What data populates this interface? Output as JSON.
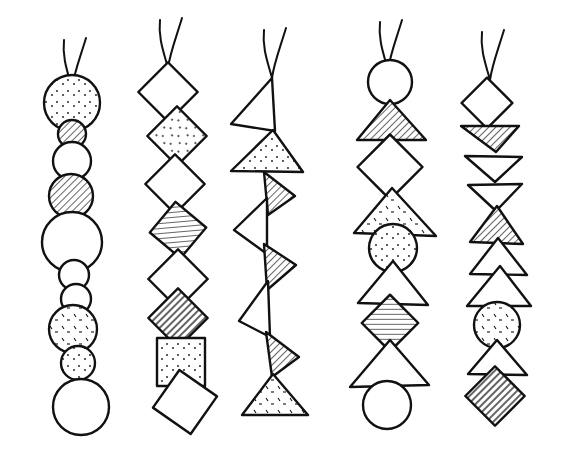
{
  "title": "Five hand-drawn bead strands",
  "colors": {
    "ink": "#111111",
    "paper": "#ffffff"
  },
  "strands": [
    {
      "id": "strand-1",
      "kind": "circles",
      "string": {
        "x": 72,
        "y": 88
      },
      "beads": [
        {
          "shape": "circle",
          "cx": 72,
          "cy": 103,
          "r": 28,
          "fill": "speckle"
        },
        {
          "shape": "circle",
          "cx": 72,
          "cy": 134,
          "r": 14,
          "fill": "hatch"
        },
        {
          "shape": "circle",
          "cx": 72,
          "cy": 161,
          "r": 19,
          "fill": "plain"
        },
        {
          "shape": "circle",
          "cx": 71,
          "cy": 196,
          "r": 22,
          "fill": "hatch"
        },
        {
          "shape": "circle",
          "cx": 72,
          "cy": 242,
          "r": 30,
          "fill": "plain"
        },
        {
          "shape": "circle",
          "cx": 74,
          "cy": 275,
          "r": 15,
          "fill": "plain"
        },
        {
          "shape": "circle",
          "cx": 76,
          "cy": 299,
          "r": 15,
          "fill": "plain"
        },
        {
          "shape": "circle",
          "cx": 73,
          "cy": 329,
          "r": 24,
          "fill": "dash"
        },
        {
          "shape": "circle",
          "cx": 78,
          "cy": 363,
          "r": 17,
          "fill": "speckle"
        },
        {
          "shape": "circle",
          "cx": 81,
          "cy": 407,
          "r": 28,
          "fill": "plain"
        }
      ]
    },
    {
      "id": "strand-2",
      "kind": "diamonds",
      "string": {
        "x": 168,
        "y": 68
      },
      "beads": [
        {
          "shape": "diamond",
          "cx": 168,
          "cy": 92,
          "s": 42,
          "rot": 45,
          "fill": "plain"
        },
        {
          "shape": "diamond",
          "cx": 177,
          "cy": 136,
          "s": 42,
          "rot": 45,
          "fill": "speckle"
        },
        {
          "shape": "diamond",
          "cx": 175,
          "cy": 184,
          "s": 42,
          "rot": 45,
          "fill": "plain"
        },
        {
          "shape": "diamond",
          "cx": 178,
          "cy": 230,
          "s": 40,
          "rot": 40,
          "fill": "hatch"
        },
        {
          "shape": "diamond",
          "cx": 178,
          "cy": 279,
          "s": 42,
          "rot": 45,
          "fill": "plain"
        },
        {
          "shape": "diamond",
          "cx": 178,
          "cy": 318,
          "s": 42,
          "rot": 45,
          "fill": "vhatch"
        },
        {
          "shape": "square",
          "cx": 181,
          "cy": 362,
          "s": 48,
          "rot": 0,
          "fill": "speckle"
        },
        {
          "shape": "diamond",
          "cx": 185,
          "cy": 402,
          "s": 46,
          "rot": 35,
          "fill": "plain"
        }
      ]
    },
    {
      "id": "strand-3",
      "kind": "triangles",
      "string": {
        "x": 272,
        "y": 78
      },
      "beads": [
        {
          "shape": "tri",
          "pts": [
            [
              272,
              78
            ],
            [
              275,
              131
            ],
            [
              231,
              124
            ]
          ],
          "fill": "plain"
        },
        {
          "shape": "tri",
          "pts": [
            [
              273,
              130
            ],
            [
              303,
              172
            ],
            [
              231,
              171
            ]
          ],
          "fill": "speckle"
        },
        {
          "shape": "tri",
          "pts": [
            [
              264,
              172
            ],
            [
              295,
              196
            ],
            [
              268,
              215
            ]
          ],
          "fill": "hatch"
        },
        {
          "shape": "tri",
          "pts": [
            [
              267,
              198
            ],
            [
              267,
              254
            ],
            [
              234,
              230
            ]
          ],
          "fill": "plain"
        },
        {
          "shape": "tri",
          "pts": [
            [
              264,
              244
            ],
            [
              296,
              265
            ],
            [
              267,
              290
            ]
          ],
          "fill": "hatch"
        },
        {
          "shape": "tri",
          "pts": [
            [
              268,
              281
            ],
            [
              270,
              337
            ],
            [
              239,
              321
            ]
          ],
          "fill": "plain"
        },
        {
          "shape": "tri",
          "pts": [
            [
              266,
              332
            ],
            [
              299,
              357
            ],
            [
              272,
              377
            ]
          ],
          "fill": "hatch"
        },
        {
          "shape": "tri",
          "pts": [
            [
              273,
              374
            ],
            [
              308,
              415
            ],
            [
              242,
              415
            ]
          ],
          "fill": "dash"
        }
      ]
    },
    {
      "id": "strand-4",
      "kind": "mixed",
      "string": {
        "x": 388,
        "y": 70
      },
      "beads": [
        {
          "shape": "circle",
          "cx": 390,
          "cy": 82,
          "r": 22,
          "fill": "plain"
        },
        {
          "shape": "tri",
          "pts": [
            [
              390,
              100
            ],
            [
              426,
              140
            ],
            [
              357,
              140
            ]
          ],
          "fill": "hatch"
        },
        {
          "shape": "diamond",
          "cx": 390,
          "cy": 167,
          "s": 46,
          "rot": 45,
          "fill": "plain"
        },
        {
          "shape": "tri",
          "pts": [
            [
              392,
              188
            ],
            [
              436,
              236
            ],
            [
              354,
              233
            ]
          ],
          "fill": "dash"
        },
        {
          "shape": "circle",
          "cx": 393,
          "cy": 248,
          "r": 24,
          "fill": "speckle"
        },
        {
          "shape": "tri",
          "pts": [
            [
              393,
              261
            ],
            [
              428,
              305
            ],
            [
              358,
              303
            ]
          ],
          "fill": "plain"
        },
        {
          "shape": "diamond",
          "cx": 390,
          "cy": 323,
          "s": 40,
          "rot": 45,
          "fill": "hatch"
        },
        {
          "shape": "tri",
          "pts": [
            [
              390,
              340
            ],
            [
              429,
              385
            ],
            [
              350,
              387
            ]
          ],
          "fill": "plain"
        },
        {
          "shape": "circle",
          "cx": 387,
          "cy": 405,
          "r": 24,
          "fill": "plain"
        }
      ]
    },
    {
      "id": "strand-5",
      "kind": "mixed",
      "string": {
        "x": 490,
        "y": 80
      },
      "beads": [
        {
          "shape": "diamond",
          "cx": 487,
          "cy": 103,
          "s": 36,
          "rot": 45,
          "fill": "plain"
        },
        {
          "shape": "tri",
          "pts": [
            [
              461,
              126
            ],
            [
              519,
              126
            ],
            [
              496,
              152
            ]
          ],
          "fill": "hatch"
        },
        {
          "shape": "tri",
          "pts": [
            [
              465,
              156
            ],
            [
              522,
              157
            ],
            [
              495,
              182
            ]
          ],
          "fill": "plain"
        },
        {
          "shape": "tri",
          "pts": [
            [
              468,
              185
            ],
            [
              522,
              184
            ],
            [
              496,
              211
            ]
          ],
          "fill": "plain"
        },
        {
          "shape": "tri",
          "pts": [
            [
              497,
              206
            ],
            [
              523,
              244
            ],
            [
              470,
              242
            ]
          ],
          "fill": "hatch"
        },
        {
          "shape": "tri",
          "pts": [
            [
              498,
              238
            ],
            [
              527,
              275
            ],
            [
              470,
              274
            ]
          ],
          "fill": "plain"
        },
        {
          "shape": "tri",
          "pts": [
            [
              500,
              266
            ],
            [
              531,
              306
            ],
            [
              467,
              306
            ]
          ],
          "fill": "plain"
        },
        {
          "shape": "circle",
          "cx": 497,
          "cy": 325,
          "r": 23,
          "fill": "dash"
        },
        {
          "shape": "tri",
          "pts": [
            [
              497,
              340
            ],
            [
              527,
              375
            ],
            [
              468,
              374
            ]
          ],
          "fill": "plain"
        },
        {
          "shape": "diamond",
          "cx": 495,
          "cy": 396,
          "s": 42,
          "rot": 45,
          "fill": "vhatch"
        }
      ]
    }
  ]
}
